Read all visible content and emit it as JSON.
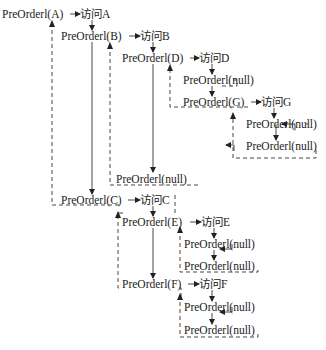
{
  "diagram": {
    "type": "preorder-recursion-trace",
    "nodes": [
      {
        "id": "callA",
        "label": "PreOrderl(A)",
        "x": 2,
        "y": 9
      },
      {
        "id": "visitA",
        "label": "访问A",
        "x": 80,
        "y": 9
      },
      {
        "id": "callB",
        "label": "PreOrderl(B)",
        "x": 61,
        "y": 31
      },
      {
        "id": "visitB",
        "label": "访问B",
        "x": 140,
        "y": 31
      },
      {
        "id": "callD",
        "label": "PreOrderl(D)",
        "x": 122,
        "y": 53
      },
      {
        "id": "visitD",
        "label": "访问D",
        "x": 199,
        "y": 53
      },
      {
        "id": "callDnull",
        "label": "PreOrderl(null)",
        "x": 183,
        "y": 75
      },
      {
        "id": "callG",
        "label": "PreOrderl(G)",
        "x": 183,
        "y": 97
      },
      {
        "id": "visitG",
        "label": "访问G",
        "x": 261,
        "y": 97
      },
      {
        "id": "callGnull1",
        "label": "PreOrderl(null)",
        "x": 246,
        "y": 119
      },
      {
        "id": "callGnull2",
        "label": "PreOrderl(null)",
        "x": 246,
        "y": 141
      },
      {
        "id": "callBnull",
        "label": "PreOrderl(null)",
        "x": 116,
        "y": 173
      },
      {
        "id": "callC",
        "label": "PreOrderl(C)",
        "x": 61,
        "y": 195
      },
      {
        "id": "visitC",
        "label": "访问C",
        "x": 140,
        "y": 195
      },
      {
        "id": "callE",
        "label": "PreOrderl(E)",
        "x": 122,
        "y": 217
      },
      {
        "id": "visitE",
        "label": "访问E",
        "x": 201,
        "y": 217
      },
      {
        "id": "callEnull1",
        "label": "PreOrderl(null)",
        "x": 184,
        "y": 239
      },
      {
        "id": "callEnull2",
        "label": "PreOrderl(null)",
        "x": 184,
        "y": 261
      },
      {
        "id": "callF",
        "label": "PreOrderl(F)",
        "x": 122,
        "y": 279
      },
      {
        "id": "visitF",
        "label": "访问F",
        "x": 199,
        "y": 279
      },
      {
        "id": "callFnull1",
        "label": "PreOrderl(null)",
        "x": 184,
        "y": 302
      },
      {
        "id": "callFnull2",
        "label": "PreOrderl(null)",
        "x": 184,
        "y": 325
      }
    ]
  }
}
